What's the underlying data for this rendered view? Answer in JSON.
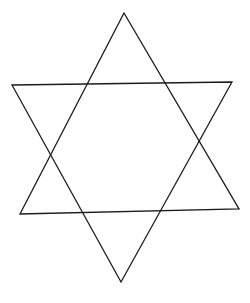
{
  "figure": {
    "width": 250,
    "height": 303,
    "background": "#ffffff",
    "stroke_color": "#1a1a1a",
    "stroke_width": 1.3,
    "shape": "hexagram",
    "triangles": [
      {
        "name": "upward-triangle",
        "points": "124,13 20,214 239,209"
      },
      {
        "name": "downward-triangle",
        "points": "12,85 232,82 121,282"
      }
    ]
  }
}
